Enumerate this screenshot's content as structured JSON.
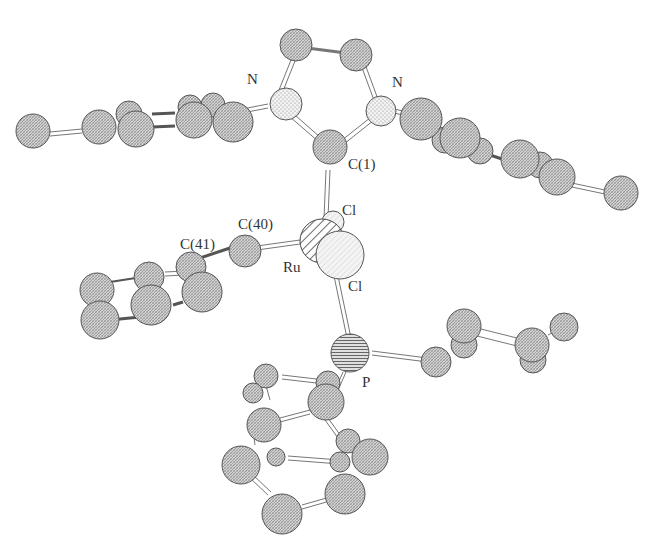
{
  "figure": {
    "type": "ball-and-stick crystal structure",
    "molecule": "Ruthenium carbene complex"
  },
  "labels": {
    "n_left": "N",
    "n_right": "N",
    "c1": "C(1)",
    "cl_top": "Cl",
    "c40": "C(40)",
    "c41": "C(41)",
    "ru": "Ru",
    "cl_bottom": "Cl",
    "p": "P"
  },
  "colors": {
    "carbon_fill": "#c4c4c4",
    "nitrogen_fill": "#eeeeee",
    "ruthenium_fill": "#dddddd",
    "chlorine_fill": "#f0f0f0",
    "phosphorus_fill": "#bdbdbd",
    "outline": "#555555",
    "bond": "#777777"
  }
}
